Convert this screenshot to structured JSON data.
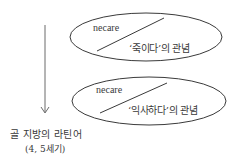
{
  "diagram": {
    "source": {
      "label": "골 지방의 라틴어",
      "period": "(4, 5세기)"
    },
    "stages": [
      {
        "word": "necare",
        "meaning": "‘죽이다’의 관념"
      },
      {
        "word": "necare",
        "meaning": "‘익사하다’의 관념"
      }
    ],
    "colors": {
      "stroke": "#3a3a3a",
      "arrow": "#6a6a6a",
      "background": "#ffffff"
    }
  }
}
